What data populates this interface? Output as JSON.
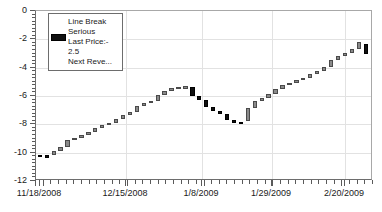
{
  "chart_data": {
    "type": "bar",
    "title": "",
    "subtitle": "",
    "xlabel": "",
    "ylabel": "",
    "ylim": [
      -12,
      0
    ],
    "xlim": [
      "11/18/2008",
      "2/27/2009"
    ],
    "grid": true,
    "y_ticks": [
      0,
      -2,
      -4,
      -6,
      -8,
      -10,
      -12
    ],
    "y_tick_labels": [
      "0",
      "-2",
      "-4",
      "-6",
      "-8",
      "-10",
      "-12"
    ],
    "x_tick_labels": [
      "11/18/2008",
      "12/15/2008",
      "1/8/2009",
      "1/29/2009",
      "2/20/2009"
    ],
    "x_tick_positions": [
      0.012,
      0.268,
      0.492,
      0.7,
      0.918
    ],
    "series_name": "Line Break Serious",
    "up_color": "#8a8a8a",
    "down_color": "#101010",
    "blocks": [
      {
        "i": 0,
        "open": -10.3,
        "close": -10.15,
        "dir": "down"
      },
      {
        "i": 1,
        "open": -10.35,
        "close": -10.15,
        "dir": "down"
      },
      {
        "i": 2,
        "open": -10.15,
        "close": -9.85,
        "dir": "up"
      },
      {
        "i": 3,
        "open": -9.85,
        "close": -9.6,
        "dir": "up"
      },
      {
        "i": 4,
        "open": -9.6,
        "close": -9.1,
        "dir": "up"
      },
      {
        "i": 5,
        "open": -9.1,
        "close": -8.95,
        "dir": "up"
      },
      {
        "i": 6,
        "open": -8.95,
        "close": -8.75,
        "dir": "up"
      },
      {
        "i": 7,
        "open": -8.75,
        "close": -8.55,
        "dir": "up"
      },
      {
        "i": 8,
        "open": -8.55,
        "close": -8.25,
        "dir": "up"
      },
      {
        "i": 9,
        "open": -8.25,
        "close": -8.05,
        "dir": "up"
      },
      {
        "i": 10,
        "open": -8.05,
        "close": -7.9,
        "dir": "up"
      },
      {
        "i": 11,
        "open": -7.9,
        "close": -7.6,
        "dir": "up"
      },
      {
        "i": 12,
        "open": -7.6,
        "close": -7.35,
        "dir": "up"
      },
      {
        "i": 13,
        "open": -7.35,
        "close": -7.15,
        "dir": "up"
      },
      {
        "i": 14,
        "open": -7.15,
        "close": -6.7,
        "dir": "up"
      },
      {
        "i": 15,
        "open": -6.7,
        "close": -6.5,
        "dir": "up"
      },
      {
        "i": 16,
        "open": -6.5,
        "close": -6.35,
        "dir": "up"
      },
      {
        "i": 17,
        "open": -6.35,
        "close": -5.95,
        "dir": "up"
      },
      {
        "i": 18,
        "open": -5.95,
        "close": -5.65,
        "dir": "up"
      },
      {
        "i": 19,
        "open": -5.65,
        "close": -5.45,
        "dir": "up"
      },
      {
        "i": 20,
        "open": -5.45,
        "close": -5.35,
        "dir": "up"
      },
      {
        "i": 21,
        "open": -5.35,
        "close": -5.3,
        "dir": "up"
      },
      {
        "i": 22,
        "open": -5.35,
        "close": -6.0,
        "dir": "down"
      },
      {
        "i": 23,
        "open": -6.0,
        "close": -6.25,
        "dir": "down"
      },
      {
        "i": 24,
        "open": -6.25,
        "close": -6.8,
        "dir": "down"
      },
      {
        "i": 25,
        "open": -6.8,
        "close": -7.05,
        "dir": "down"
      },
      {
        "i": 26,
        "open": -7.05,
        "close": -7.25,
        "dir": "down"
      },
      {
        "i": 27,
        "open": -7.25,
        "close": -7.7,
        "dir": "down"
      },
      {
        "i": 28,
        "open": -7.7,
        "close": -7.8,
        "dir": "down"
      },
      {
        "i": 29,
        "open": -7.8,
        "close": -7.8,
        "dir": "down"
      },
      {
        "i": 30,
        "open": -7.8,
        "close": -6.85,
        "dir": "up"
      },
      {
        "i": 31,
        "open": -6.85,
        "close": -6.35,
        "dir": "up"
      },
      {
        "i": 32,
        "open": -6.35,
        "close": -6.15,
        "dir": "up"
      },
      {
        "i": 33,
        "open": -6.15,
        "close": -5.85,
        "dir": "up"
      },
      {
        "i": 34,
        "open": -5.85,
        "close": -5.5,
        "dir": "up"
      },
      {
        "i": 35,
        "open": -5.5,
        "close": -5.2,
        "dir": "up"
      },
      {
        "i": 36,
        "open": -5.2,
        "close": -5.05,
        "dir": "up"
      },
      {
        "i": 37,
        "open": -5.05,
        "close": -4.85,
        "dir": "up"
      },
      {
        "i": 38,
        "open": -4.85,
        "close": -4.7,
        "dir": "up"
      },
      {
        "i": 39,
        "open": -4.7,
        "close": -4.45,
        "dir": "up"
      },
      {
        "i": 40,
        "open": -4.45,
        "close": -4.25,
        "dir": "up"
      },
      {
        "i": 41,
        "open": -4.25,
        "close": -3.95,
        "dir": "up"
      },
      {
        "i": 42,
        "open": -3.95,
        "close": -3.45,
        "dir": "up"
      },
      {
        "i": 43,
        "open": -3.45,
        "close": -3.2,
        "dir": "up"
      },
      {
        "i": 44,
        "open": -3.2,
        "close": -2.95,
        "dir": "up"
      },
      {
        "i": 45,
        "open": -2.95,
        "close": -2.7,
        "dir": "up"
      },
      {
        "i": 46,
        "open": -2.7,
        "close": -2.2,
        "dir": "up"
      },
      {
        "i": 47,
        "open": -2.35,
        "close": -3.05,
        "dir": "down"
      }
    ]
  },
  "legend": {
    "swatch_name": "last-price-swatch",
    "line1": "Line Break",
    "line2": "Serious",
    "line3": "Last Price:-",
    "line4": "2.5",
    "line5": "Next Reve..."
  }
}
